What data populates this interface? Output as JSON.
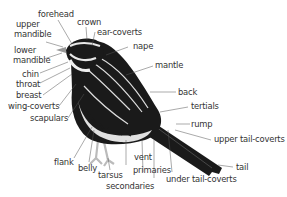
{
  "diagram": {
    "colors": {
      "label_text": "#333333",
      "leader_line": "#555555",
      "plumage_dark": "#1a1a1a",
      "plumage_light": "#e8e8e8",
      "background": "#ffffff"
    },
    "labels": {
      "forehead": "forehead",
      "crown": "crown",
      "upper_mandible_1": "upper",
      "upper_mandible_2": "mandible",
      "ear_coverts": "ear-coverts",
      "lower_mandible_1": "lower",
      "lower_mandible_2": "mandible",
      "nape": "nape",
      "mantle": "mantle",
      "chin": "chin",
      "throat": "throat",
      "breast": "breast",
      "wing_coverts": "wing-coverts",
      "scapulars": "scapulars",
      "back": "back",
      "tertials": "tertials",
      "rump": "rump",
      "upper_tail_coverts": "upper tail-coverts",
      "tail": "tail",
      "flank": "flank",
      "belly": "belly",
      "tarsus": "tarsus",
      "vent": "vent",
      "primaries": "primaries",
      "secondaries": "secondaries",
      "under_tail_coverts": "under tail-coverts"
    }
  }
}
